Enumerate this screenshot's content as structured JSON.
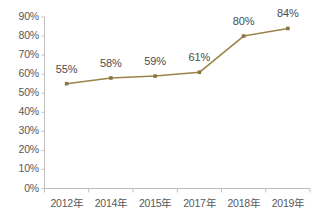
{
  "chart_data": {
    "type": "line",
    "title": "",
    "subtitle": "",
    "xlabel": "",
    "ylabel": "",
    "categories": [
      "2012年",
      "2014年",
      "2015年",
      "2017年",
      "2018年",
      "2019年"
    ],
    "series": [
      {
        "name": "",
        "values": [
          55,
          58,
          59,
          61,
          80,
          84
        ],
        "data_labels": [
          "55%",
          "58%",
          "59%",
          "61%",
          "80%",
          "84%"
        ],
        "line_color": "#9a8448",
        "marker_color": "#8a7540",
        "marker_shape": "square"
      }
    ],
    "ylim": [
      0,
      90
    ],
    "ytick_values": [
      0,
      10,
      20,
      30,
      40,
      50,
      60,
      70,
      80,
      90
    ],
    "ytick_labels": [
      "0%",
      "10%",
      "20%",
      "30%",
      "40%",
      "50%",
      "60%",
      "70%",
      "80%",
      "90%"
    ],
    "grid": false,
    "legend": false,
    "legend_position": "none",
    "axis_color": "#bfbfbf",
    "tick_label_color": "#58585a",
    "data_label_color": "#4c4c4e",
    "background_color": "#ffffff",
    "value_suffix": "%"
  },
  "axes": {
    "y_axis_name": "percentage-axis",
    "x_axis_name": "year-axis"
  }
}
